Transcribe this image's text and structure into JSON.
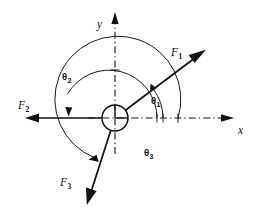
{
  "figure": {
    "background_color": "#ffffff",
    "ink_color": "#111111",
    "width": 257,
    "height": 223
  },
  "origin": {
    "label": "origin-hub",
    "x": 115,
    "y": 118,
    "circle_radius": 13
  },
  "axes": [
    {
      "id": "y-axis",
      "label": "y",
      "orientation": "vertical",
      "direction": "up",
      "line_style": "dash-dot",
      "arrow": "solid",
      "label_x": 97,
      "label_y": 19
    },
    {
      "id": "x-axis",
      "label": "x",
      "orientation": "horizontal",
      "direction": "right",
      "line_style": "dash-dot",
      "arrow": "solid",
      "label_x": 238,
      "label_y": 125
    }
  ],
  "forces": [
    {
      "id": "force-1",
      "symbol": "F",
      "subscript": "1",
      "label": "F1",
      "angle_deg": 37,
      "length": 105,
      "arrow": "solid",
      "label_x": 171,
      "label_y": 47
    },
    {
      "id": "force-2",
      "symbol": "F",
      "subscript": "2",
      "label": "F2",
      "angle_deg": 180,
      "length": 102,
      "arrow": "solid",
      "label_x": 18,
      "label_y": 100
    },
    {
      "id": "force-3",
      "symbol": "F",
      "subscript": "3",
      "label": "F3",
      "angle_deg": 251,
      "length": 103,
      "arrow": "solid",
      "label_x": 60,
      "label_y": 177
    }
  ],
  "angles": [
    {
      "id": "angle-theta-1",
      "symbol": "θ",
      "subscript": "1",
      "label": "θ1",
      "from_deg": 0,
      "to_deg": 37,
      "radius": 48,
      "arrow_end": "counterclockwise",
      "label_x": 151,
      "label_y": 96
    },
    {
      "id": "angle-theta-2",
      "symbol": "θ",
      "subscript": "2",
      "label": "θ2",
      "from_deg": 0,
      "to_deg": 180,
      "radius": 48,
      "arrow_end": "counterclockwise",
      "label_x": 62,
      "label_y": 72
    },
    {
      "id": "angle-theta-3",
      "symbol": "θ",
      "subscript": "3",
      "label": "θ3",
      "from_deg": 0,
      "to_deg": 251,
      "radius": 63,
      "arrow_end": "counterclockwise",
      "label_x": 144,
      "label_y": 148
    }
  ]
}
